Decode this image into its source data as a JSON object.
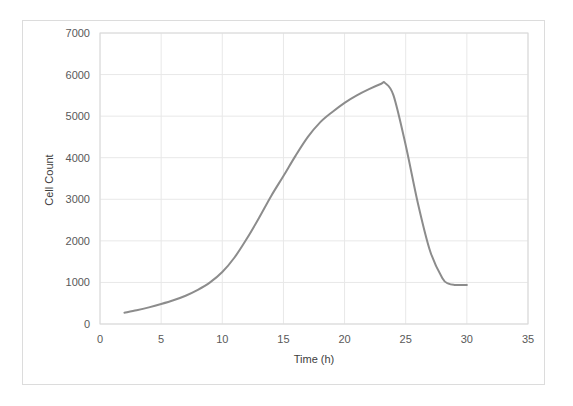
{
  "chart_data": {
    "type": "line",
    "title": "",
    "xlabel": "Time (h)",
    "ylabel": "Cell Count",
    "xlim": [
      0,
      35
    ],
    "ylim": [
      0,
      7000
    ],
    "xticks": [
      0,
      5,
      10,
      15,
      20,
      25,
      30,
      35
    ],
    "yticks": [
      0,
      1000,
      2000,
      3000,
      4000,
      5000,
      6000,
      7000
    ],
    "xtick_labels": [
      "0",
      "5",
      "10",
      "15",
      "20",
      "25",
      "30",
      "35"
    ],
    "ytick_labels": [
      "0",
      "1000",
      "2000",
      "3000",
      "4000",
      "5000",
      "6000",
      "7000"
    ],
    "grid": "horizontal-and-vertical",
    "grid_color": "#e8e8e8",
    "legend": "none",
    "series": [
      {
        "name": "Cell Count",
        "color": "#8c8c8c",
        "line_width": 2,
        "markers": "none",
        "x": [
          2,
          3,
          4,
          5,
          6,
          7,
          8,
          9,
          10,
          11,
          12,
          13,
          14,
          15,
          16,
          17,
          18,
          19,
          20,
          21,
          22,
          23,
          23.3,
          24,
          25,
          26,
          27,
          28,
          28.5,
          29,
          30
        ],
        "y": [
          270,
          330,
          400,
          480,
          570,
          680,
          820,
          1000,
          1250,
          1600,
          2050,
          2550,
          3080,
          3560,
          4050,
          4500,
          4850,
          5100,
          5320,
          5500,
          5650,
          5780,
          5800,
          5500,
          4300,
          2900,
          1750,
          1100,
          970,
          940,
          940
        ]
      }
    ]
  },
  "axis": {
    "y_label": "Cell Count",
    "x_label": "Time (h)"
  },
  "colors": {
    "line": "#8c8c8c",
    "grid": "#e8e8e8",
    "axis_text": "#595959",
    "frame": "#dcdcdc",
    "plot_border": "#d9d9d9"
  }
}
